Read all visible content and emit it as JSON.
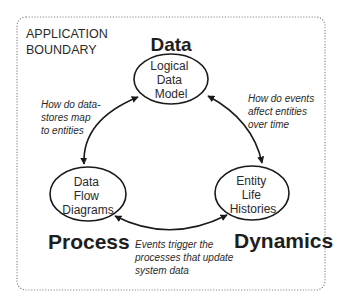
{
  "diagram": {
    "boundary": {
      "label_lines": [
        "APPLICATION",
        "BOUNDARY"
      ],
      "style": "dotted",
      "color": "#8a8a8a"
    },
    "headings": {
      "data": "Data",
      "process": "Process",
      "dynamics": "Dynamics"
    },
    "nodes": [
      {
        "id": "logical-data-model",
        "lines": [
          "Logical",
          "Data",
          "Model"
        ]
      },
      {
        "id": "data-flow-diagrams",
        "lines": [
          "Data",
          "Flow",
          "Diagrams"
        ]
      },
      {
        "id": "entity-life-histories",
        "lines": [
          "Entity",
          "Life",
          "Histories"
        ]
      }
    ],
    "edges": [
      {
        "from": "logical-data-model",
        "to": "data-flow-diagrams",
        "bidirectional": true,
        "note_lines": [
          "How do data-",
          "stores map",
          "to entities"
        ]
      },
      {
        "from": "logical-data-model",
        "to": "entity-life-histories",
        "bidirectional": true,
        "note_lines": [
          "How do events",
          "affect entities",
          "over time"
        ]
      },
      {
        "from": "data-flow-diagrams",
        "to": "entity-life-histories",
        "bidirectional": true,
        "note_lines": [
          "Events trigger the",
          "processes that update",
          "system data"
        ]
      }
    ],
    "colors": {
      "stroke": "#1a1a1a",
      "text": "#2a2a2a",
      "background": "#ffffff"
    }
  }
}
